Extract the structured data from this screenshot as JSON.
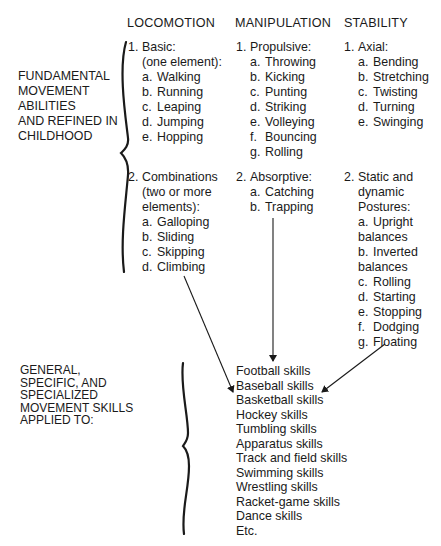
{
  "headers": {
    "locomotion": "LOCOMOTION",
    "manipulation": "MANIPULATION",
    "stability": "STABILITY"
  },
  "left_labels": {
    "fundamental": [
      "FUNDAMENTAL",
      "MOVEMENT",
      "ABILITIES",
      "AND REFINED IN",
      "CHILDHOOD"
    ],
    "general": [
      "GENERAL,",
      "SPECIFIC, AND",
      "SPECIALIZED",
      "MOVEMENT SKILLS",
      "APPLIED TO:"
    ]
  },
  "locomotion": {
    "group1": {
      "number": "1.",
      "title": "Basic:",
      "subtitle": "(one element):",
      "items": [
        {
          "letter": "a.",
          "label": "Walking"
        },
        {
          "letter": "b.",
          "label": "Running"
        },
        {
          "letter": "c.",
          "label": "Leaping"
        },
        {
          "letter": "d.",
          "label": "Jumping"
        },
        {
          "letter": "e.",
          "label": "Hopping"
        }
      ]
    },
    "group2": {
      "number": "2.",
      "title": "Combinations",
      "subtitle1": "(two or more",
      "subtitle2": "elements):",
      "items": [
        {
          "letter": "a.",
          "label": "Galloping"
        },
        {
          "letter": "b.",
          "label": "Sliding"
        },
        {
          "letter": "c.",
          "label": "Skipping"
        },
        {
          "letter": "d.",
          "label": "Climbing"
        }
      ]
    }
  },
  "manipulation": {
    "group1": {
      "number": "1.",
      "title": "Propulsive:",
      "items": [
        {
          "letter": "a.",
          "label": "Throwing"
        },
        {
          "letter": "b.",
          "label": "Kicking"
        },
        {
          "letter": "c.",
          "label": "Punting"
        },
        {
          "letter": "d.",
          "label": "Striking"
        },
        {
          "letter": "e.",
          "label": "Volleying"
        },
        {
          "letter": "f.",
          "label": "Bouncing"
        },
        {
          "letter": "g.",
          "label": "Rolling"
        }
      ]
    },
    "group2": {
      "number": "2.",
      "title": "Absorptive:",
      "items": [
        {
          "letter": "a.",
          "label": "Catching"
        },
        {
          "letter": "b.",
          "label": "Trapping"
        }
      ]
    }
  },
  "stability": {
    "group1": {
      "number": "1.",
      "title": "Axial:",
      "items": [
        {
          "letter": "a.",
          "label": "Bending"
        },
        {
          "letter": "b.",
          "label": "Stretching"
        },
        {
          "letter": "c.",
          "label": "Twisting"
        },
        {
          "letter": "d.",
          "label": "Turning"
        },
        {
          "letter": "e.",
          "label": "Swinging"
        }
      ]
    },
    "group2": {
      "number": "2.",
      "title1": "Static and",
      "title2": "dynamic",
      "title3": "Postures:",
      "items": [
        {
          "letter": "a.",
          "label": "Upright"
        },
        {
          "letter": "",
          "label": "balances"
        },
        {
          "letter": "b.",
          "label": "Inverted"
        },
        {
          "letter": "",
          "label": "balances"
        },
        {
          "letter": "c.",
          "label": "Rolling"
        },
        {
          "letter": "d.",
          "label": "Starting"
        },
        {
          "letter": "e.",
          "label": "Stopping"
        },
        {
          "letter": "f.",
          "label": "Dodging"
        },
        {
          "letter": "g.",
          "label": "Floating"
        }
      ]
    }
  },
  "skills": [
    "Football skills",
    "Baseball skills",
    "Basketball skills",
    "Hockey skills",
    "Tumbling skills",
    "Apparatus skills",
    "Track and field skills",
    "Swimming skills",
    "Wrestling skills",
    "Racket-game skills",
    "Dance skills",
    "Etc."
  ],
  "colors": {
    "text": "#1a1a1a",
    "background": "#ffffff",
    "lines": "#1a1a1a"
  }
}
